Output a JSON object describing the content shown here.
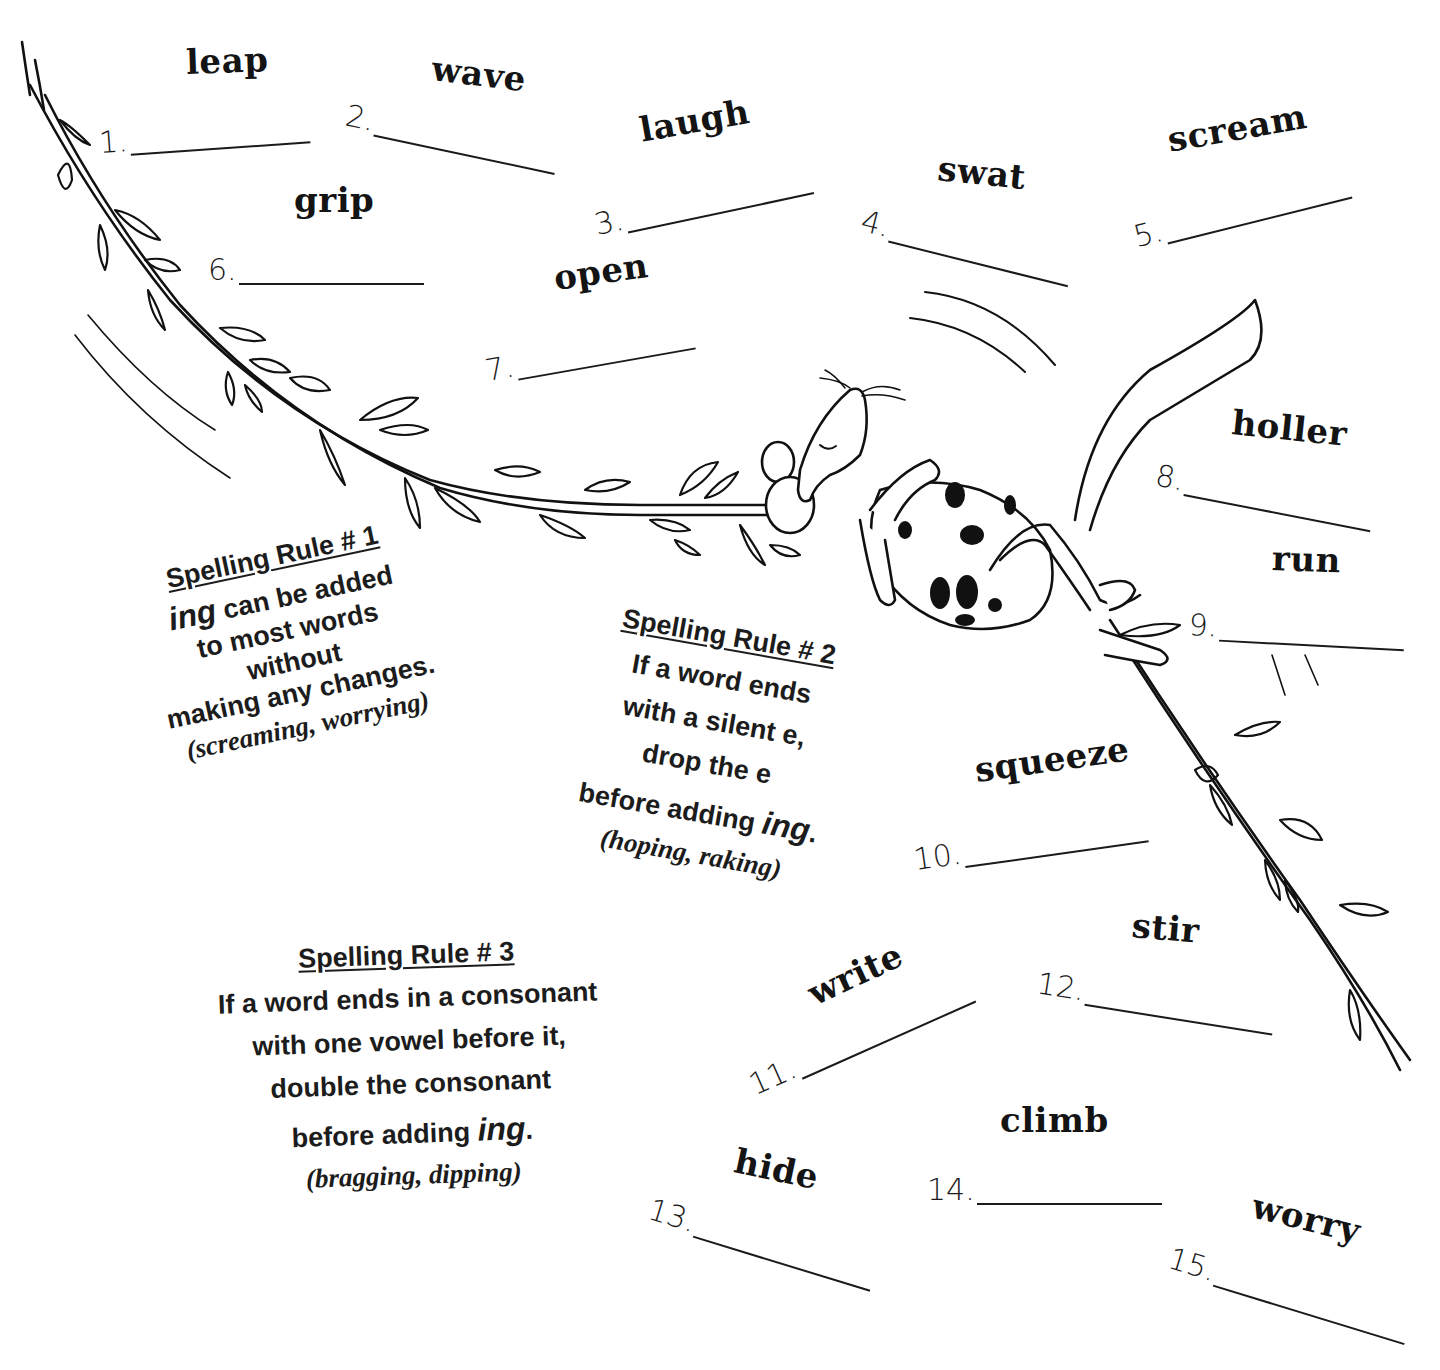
{
  "worksheet": {
    "items": [
      {
        "number": "1.",
        "word": "leap",
        "answer": ""
      },
      {
        "number": "2.",
        "word": "wave",
        "answer": ""
      },
      {
        "number": "3.",
        "word": "laugh",
        "answer": ""
      },
      {
        "number": "4.",
        "word": "swat",
        "answer": ""
      },
      {
        "number": "5.",
        "word": "scream",
        "answer": ""
      },
      {
        "number": "6.",
        "word": "grip",
        "answer": ""
      },
      {
        "number": "7.",
        "word": "open",
        "answer": ""
      },
      {
        "number": "8.",
        "word": "holler",
        "answer": ""
      },
      {
        "number": "9.",
        "word": "run",
        "answer": ""
      },
      {
        "number": "10.",
        "word": "squeeze",
        "answer": ""
      },
      {
        "number": "11.",
        "word": "write",
        "answer": ""
      },
      {
        "number": "12.",
        "word": "stir",
        "answer": ""
      },
      {
        "number": "13.",
        "word": "hide",
        "answer": ""
      },
      {
        "number": "14.",
        "word": "climb",
        "answer": ""
      },
      {
        "number": "15.",
        "word": "worry",
        "answer": ""
      }
    ]
  },
  "rules": [
    {
      "title": "Spelling Rule # 1",
      "lines": [
        "ing",
        " can be added",
        "to most words",
        "without",
        "making any changes."
      ],
      "example": "(screaming, worrying)"
    },
    {
      "title": "Spelling Rule # 2",
      "lines": [
        "If a word ends",
        "with a silent e,",
        "drop the e",
        "before adding ",
        "ing",
        "."
      ],
      "example": "(hoping, raking)"
    },
    {
      "title": "Spelling Rule # 3",
      "lines": [
        "If a word ends in a consonant",
        "with one vowel before it,",
        "double the consonant",
        "before adding ",
        "ing",
        "."
      ],
      "example": "(bragging, dipping)"
    }
  ],
  "illustration": {
    "subject": "mouse-swinging-on-vine"
  }
}
